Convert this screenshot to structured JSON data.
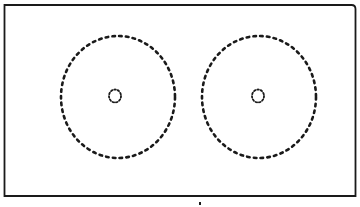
{
  "figure": {
    "background": "#ffffff",
    "stroke_color": "#1a1a1a",
    "frame": {
      "x": 4.5,
      "y": 5,
      "width": 351,
      "height": 191,
      "stroke_width": 1.8,
      "corner_radius_top_right": 4
    },
    "shapes": [
      {
        "name": "left-outer-dotted-ellipse",
        "cx": 118,
        "cy": 97,
        "rx": 57,
        "ry": 61,
        "stroke_width": 2.6,
        "dash": "2.6 4.2"
      },
      {
        "name": "left-inner-dotted-circle",
        "cx": 115,
        "cy": 96,
        "rx": 6,
        "ry": 6.5,
        "stroke_width": 1.8,
        "dash": "1.6 1.9"
      },
      {
        "name": "right-outer-dotted-ellipse",
        "cx": 259,
        "cy": 97,
        "rx": 57,
        "ry": 61,
        "stroke_width": 2.6,
        "dash": "2.6 4.2"
      },
      {
        "name": "right-inner-dotted-circle",
        "cx": 258,
        "cy": 96,
        "rx": 6,
        "ry": 6.5,
        "stroke_width": 1.8,
        "dash": "1.6 1.9"
      }
    ],
    "bottom_mark": {
      "x": 199,
      "y": 202,
      "width": 2,
      "height": 3
    }
  }
}
